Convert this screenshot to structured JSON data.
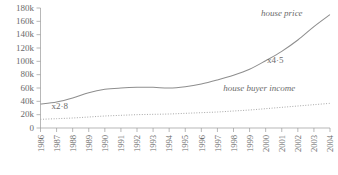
{
  "chart_data": {
    "type": "line",
    "title": "",
    "subtitle": "",
    "xlabel": "",
    "ylabel": "",
    "grid": false,
    "legend_position": "inline-annotation",
    "x": [
      1986,
      1987,
      1988,
      1989,
      1990,
      1991,
      1992,
      1993,
      1994,
      1995,
      1996,
      1997,
      1998,
      1999,
      2000,
      2001,
      2002,
      2003,
      2004
    ],
    "categories": [
      "1986",
      "1987",
      "1988",
      "1989",
      "1990",
      "1991",
      "1992",
      "1993",
      "1994",
      "1995",
      "1996",
      "1997",
      "1998",
      "1999",
      "2000",
      "2001",
      "2002",
      "2003",
      "2004"
    ],
    "xlim": [
      1986,
      2004
    ],
    "ylim": [
      0,
      180000
    ],
    "yticks": [
      0,
      20000,
      40000,
      60000,
      80000,
      100000,
      120000,
      140000,
      160000,
      180000
    ],
    "ytick_labels": [
      "0",
      "20k",
      "40k",
      "60k",
      "80k",
      "100k",
      "120k",
      "140k",
      "160k",
      "180k"
    ],
    "series": [
      {
        "name": "house price",
        "style": "solid",
        "color": "#8e8e8e",
        "values": [
          36000,
          39000,
          45000,
          53000,
          58000,
          60000,
          61000,
          61000,
          60000,
          62000,
          66000,
          72000,
          79000,
          88000,
          101000,
          115000,
          132000,
          152000,
          170000
        ]
      },
      {
        "name": "house buyer income",
        "style": "dotted",
        "color": "#a8a8a8",
        "values": [
          13000,
          14000,
          15000,
          16500,
          18000,
          19000,
          20000,
          20500,
          21000,
          22000,
          23000,
          24000,
          25500,
          27000,
          29000,
          31000,
          33000,
          35000,
          37000
        ]
      }
    ],
    "annotations": [
      {
        "text": "x2·8",
        "x": 1987.2,
        "y": 28000,
        "name": "growth-multiplier-income"
      },
      {
        "text": "x4·5",
        "x": 2000.6,
        "y": 97000,
        "name": "growth-multiplier-price"
      }
    ],
    "series_labels": [
      {
        "text": "house price",
        "x": 2001.0,
        "y": 168000
      },
      {
        "text": "house buyer income",
        "x": 1999.6,
        "y": 55000
      }
    ]
  },
  "colors": {
    "background": "#ffffff",
    "axis": "#9a9a9a",
    "text": "#6b6b6b",
    "price_line": "#8e8e8e",
    "income_line": "#a8a8a8"
  }
}
